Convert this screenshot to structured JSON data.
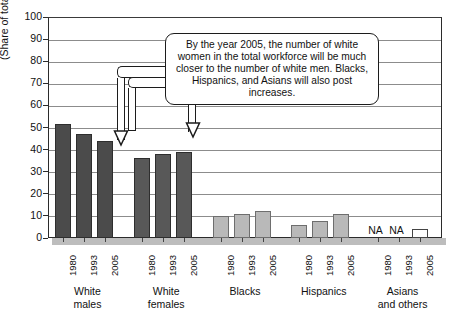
{
  "chart_data": {
    "type": "bar",
    "title": "",
    "xlabel": "",
    "ylabel": "(Share of total workers)",
    "ylim": [
      0,
      100
    ],
    "ytick_labels": [
      "100",
      "90",
      "80",
      "70",
      "60",
      "50",
      "40",
      "30",
      "20",
      "10",
      "0"
    ],
    "grid": true,
    "legend": "none",
    "categories": [
      "1980",
      "1993",
      "2005"
    ],
    "groups": [
      {
        "name": "White\nmales",
        "line1": "White",
        "line2": "males",
        "values": [
          51.5,
          47,
          44
        ],
        "shade": "dark"
      },
      {
        "name": "White\nfemales",
        "line1": "White",
        "line2": "females",
        "values": [
          36,
          38,
          39
        ],
        "shade": "mid"
      },
      {
        "name": "Blacks",
        "line1": "Blacks",
        "line2": "",
        "values": [
          10,
          11,
          12
        ],
        "shade": "light"
      },
      {
        "name": "Hispanics",
        "line1": "Hispanics",
        "line2": "",
        "values": [
          6,
          7.5,
          11
        ],
        "shade": "light"
      },
      {
        "name": "Asians and others",
        "line1": "Asians",
        "line2": "and others",
        "values": [
          null,
          null,
          4
        ],
        "shade": "hollow"
      }
    ],
    "missing_label": "NA",
    "annotations": [
      {
        "text": "By the year 2005, the number of white women in the total workforce will be much closer to the number of white men. Blacks, Hispanics, and Asians will also post increases.",
        "points_to": [
          "White males 2005",
          "White females 2005"
        ]
      }
    ]
  },
  "colors": {
    "bar_dark": "#4b4b4b",
    "bar_mid": "#585858",
    "bar_light": "#b9b9b9",
    "bar_hollow": "#fdfdfd",
    "axis": "#2b2b2b",
    "grid": "#8c8c8c",
    "background": "#ffffff"
  }
}
